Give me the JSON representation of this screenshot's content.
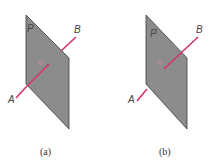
{
  "figure": {
    "panels": [
      {
        "id": "a",
        "caption": "(a)",
        "plane_label": "P",
        "point_labels": {
          "start": "A",
          "end": "B",
          "intersection": "Q"
        },
        "description": "Line AB passes through plane P"
      },
      {
        "id": "b",
        "caption": "(b)",
        "plane_label": "P",
        "point_labels": {
          "start": "A",
          "end": "B",
          "intersection": "Q"
        },
        "description": "Line AB meets plane P, segment behind plane hidden"
      }
    ],
    "colors": {
      "plane_fill": "#8c8c8c",
      "plane_edge": "#3a3a3a",
      "line": "#d4326a",
      "background": "#ffffff"
    }
  }
}
